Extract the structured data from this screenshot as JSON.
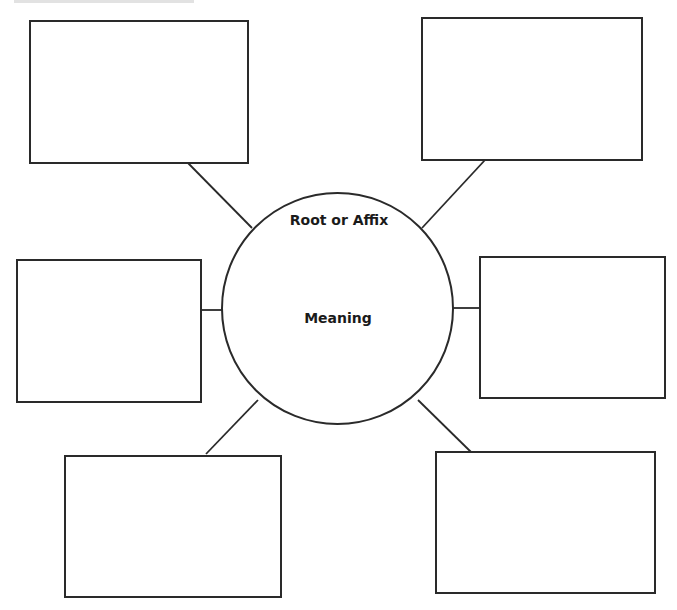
{
  "diagram": {
    "type": "word-web graphic organizer",
    "center": {
      "title": "Root or Affix",
      "subtitle": "Meaning"
    },
    "boxes": [
      {
        "id": "top-left",
        "text": ""
      },
      {
        "id": "top-right",
        "text": ""
      },
      {
        "id": "middle-left",
        "text": ""
      },
      {
        "id": "middle-right",
        "text": ""
      },
      {
        "id": "bottom-left",
        "text": ""
      },
      {
        "id": "bottom-right",
        "text": ""
      }
    ],
    "colors": {
      "stroke": "#2a2a2a",
      "background": "#ffffff",
      "text": "#1a1a1a"
    }
  }
}
